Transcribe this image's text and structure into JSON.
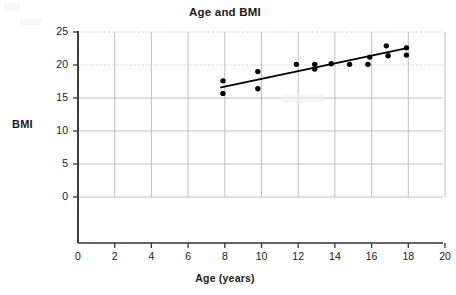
{
  "chart_data": {
    "type": "scatter",
    "title": "Age and BMI",
    "xlabel": "Age (years)",
    "ylabel": "BMI",
    "xlim": [
      0,
      20
    ],
    "ylim": [
      0,
      25
    ],
    "xticks": [
      0,
      2,
      4,
      6,
      8,
      10,
      12,
      14,
      16,
      18,
      20
    ],
    "yticks": [
      0,
      5,
      10,
      15,
      20,
      25
    ],
    "grid": true,
    "legend": "none",
    "series": [
      {
        "name": "Observations",
        "marker": "filled-circle",
        "color": "#000000",
        "points": [
          {
            "x": 7.9,
            "y": 17.6
          },
          {
            "x": 7.9,
            "y": 15.7
          },
          {
            "x": 9.8,
            "y": 19.0
          },
          {
            "x": 9.8,
            "y": 16.4
          },
          {
            "x": 11.9,
            "y": 20.1
          },
          {
            "x": 12.9,
            "y": 20.1
          },
          {
            "x": 12.9,
            "y": 19.4
          },
          {
            "x": 13.8,
            "y": 20.2
          },
          {
            "x": 14.8,
            "y": 20.1
          },
          {
            "x": 15.8,
            "y": 20.1
          },
          {
            "x": 15.9,
            "y": 21.2
          },
          {
            "x": 16.8,
            "y": 22.9
          },
          {
            "x": 16.9,
            "y": 21.4
          },
          {
            "x": 17.9,
            "y": 22.6
          },
          {
            "x": 17.9,
            "y": 21.5
          }
        ]
      }
    ],
    "trendline": {
      "name": "Line of best fit",
      "color": "#000000",
      "x_start": 7.8,
      "y_start": 16.6,
      "x_end": 18.0,
      "y_end": 22.6
    },
    "colors": {
      "marker": "#000000",
      "trendline": "#000000",
      "axis": "#333333",
      "grid": "#b9b9b9",
      "background": "#ffffff"
    }
  }
}
